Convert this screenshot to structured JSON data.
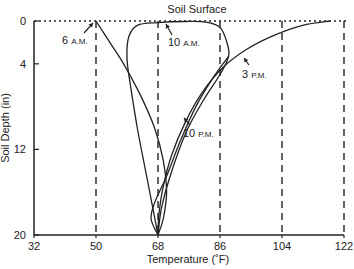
{
  "chart_data": {
    "type": "line",
    "title": "Soil Surface",
    "xlabel": "Temperature (˚F)",
    "ylabel": "Soil Depth (in)",
    "xlim": [
      32,
      122
    ],
    "ylim": [
      0,
      20
    ],
    "y_inverted": true,
    "x_ticks": [
      32,
      50,
      68,
      86,
      104,
      122
    ],
    "x_tick_labels": [
      "32",
      "50",
      "68",
      "86",
      "104",
      "122"
    ],
    "y_ticks": [
      0,
      4,
      12,
      20
    ],
    "y_tick_labels": [
      "0",
      "4",
      "12",
      "20"
    ],
    "grid": "vertical dashed lines at 50, 68, 86, 104, 122",
    "surface_line": "dotted line at depth 0",
    "series": [
      {
        "name": "6 A.M.",
        "points": [
          [
            50,
            0
          ],
          [
            54,
            2
          ],
          [
            58,
            4
          ],
          [
            63,
            7
          ],
          [
            67,
            10
          ],
          [
            69.5,
            13
          ],
          [
            70.5,
            16
          ],
          [
            69.5,
            18.5
          ],
          [
            68,
            20
          ]
        ]
      },
      {
        "name": "10 A.M.",
        "points": [
          [
            68,
            20
          ],
          [
            65,
            15
          ],
          [
            62,
            10
          ],
          [
            60,
            6
          ],
          [
            59,
            3.5
          ],
          [
            59.5,
            1.5
          ],
          [
            62,
            0.4
          ],
          [
            68,
            0.15
          ],
          [
            76,
            0.05
          ],
          [
            82,
            0.1
          ],
          [
            86,
            0.6
          ],
          [
            88,
            2
          ],
          [
            88.5,
            3.3
          ],
          [
            86,
            5
          ],
          [
            81,
            7.5
          ],
          [
            76,
            10.5
          ],
          [
            71.5,
            14.5
          ],
          [
            69,
            17.5
          ],
          [
            68,
            20
          ]
        ]
      },
      {
        "name": "3 P.M.",
        "points": [
          [
            118,
            0
          ],
          [
            110,
            0.4
          ],
          [
            102,
            1.3
          ],
          [
            94,
            2.6
          ],
          [
            87,
            4.3
          ],
          [
            81,
            6.6
          ],
          [
            76,
            9.4
          ],
          [
            72,
            12.5
          ],
          [
            69.5,
            15.5
          ],
          [
            68.3,
            18
          ],
          [
            68,
            20
          ]
        ]
      },
      {
        "name": "10 P.M.",
        "points": [
          [
            88.5,
            3.3
          ],
          [
            84,
            5.3
          ],
          [
            79,
            8
          ],
          [
            74.5,
            11.2
          ],
          [
            70.5,
            14.5
          ],
          [
            67,
            17
          ],
          [
            66,
            18.5
          ],
          [
            68,
            20
          ]
        ]
      }
    ],
    "annotations": [
      {
        "text": "6",
        "small": "A.M.",
        "series": "6 A.M."
      },
      {
        "text": "10",
        "small": "A.M.",
        "series": "10 A.M."
      },
      {
        "text": "3",
        "small": "P.M.",
        "series": "3 P.M."
      },
      {
        "text": "10",
        "small": "P.M.",
        "series": "10 P.M."
      }
    ]
  }
}
